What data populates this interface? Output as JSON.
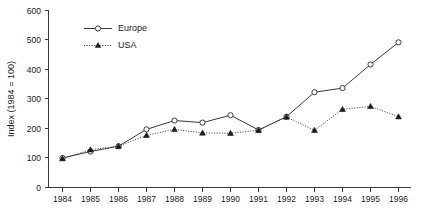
{
  "chart_data": {
    "type": "line",
    "title": "",
    "subtitle": "",
    "xlabel": "",
    "ylabel": "Index (1984 = 100)",
    "categories": [
      "1984",
      "1985",
      "1986",
      "1987",
      "1988",
      "1989",
      "1990",
      "1991",
      "1992",
      "1993",
      "1994",
      "1995",
      "1996"
    ],
    "x": [
      1984,
      1985,
      1986,
      1987,
      1988,
      1989,
      1990,
      1991,
      1992,
      1993,
      1994,
      1995,
      1996
    ],
    "xlim": [
      1984,
      1996
    ],
    "ylim": [
      0,
      600
    ],
    "y_ticks": [
      0,
      100,
      200,
      300,
      400,
      500,
      600
    ],
    "y_tick_labels": [
      "0",
      "100",
      "200",
      "300",
      "400",
      "500",
      "600"
    ],
    "grid": false,
    "legend_position": "upper-left-inside",
    "series": [
      {
        "name": "Europe",
        "marker": "open-circle",
        "line_style": "solid",
        "color": "#3a3a3a",
        "values": [
          100,
          122,
          140,
          197,
          227,
          220,
          245,
          195,
          240,
          323,
          337,
          417,
          492
        ]
      },
      {
        "name": "USA",
        "marker": "filled-triangle",
        "line_style": "dotted",
        "color": "#1a1a1a",
        "values": [
          98,
          128,
          140,
          177,
          197,
          185,
          184,
          194,
          239,
          194,
          265,
          275,
          240
        ]
      }
    ],
    "annotations": []
  },
  "legend": {
    "items": [
      {
        "label": "Europe"
      },
      {
        "label": "USA"
      }
    ]
  },
  "axes": {
    "y_title": "Index (1984 = 100)"
  }
}
